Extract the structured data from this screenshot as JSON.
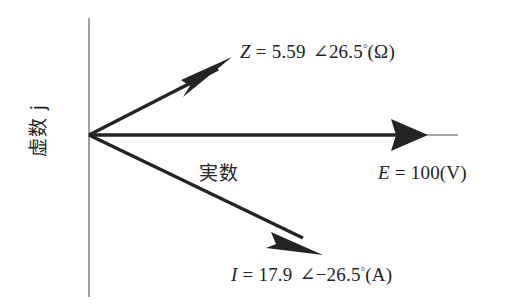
{
  "figure": {
    "type": "phasor-diagram",
    "background_color": "#ffffff",
    "ink_color": "#242424",
    "axis_color": "#8a8a8a"
  },
  "axes": {
    "imaginary_axis_label": "虚数 j",
    "real_axis_label": "実数",
    "origin": {
      "x": 89,
      "y": 135
    },
    "vertical_axis": {
      "x": 89,
      "y1": 18,
      "y2": 297
    },
    "horizontal_axis": {
      "y": 135,
      "x1": 89,
      "x2": 458
    }
  },
  "vectors": [
    {
      "name": "impedance",
      "symbol": "Z",
      "magnitude": "5.59",
      "angle": "26.5",
      "angle_sign": "+",
      "unit": "Ω",
      "label": "Z = 5.59 ∠26.5°(Ω)",
      "label_parts": {
        "symbol": "Z",
        "equals": "=",
        "magnitude": "5.59",
        "angle_symbol": "∠",
        "angle_value": "26.5",
        "degree": "°",
        "unit_paren": "(Ω)"
      },
      "tip": {
        "x": 232,
        "y": 57
      },
      "direction_deg": 26.5
    },
    {
      "name": "voltage",
      "symbol": "E",
      "magnitude": "100",
      "angle": "0",
      "unit": "V",
      "label": "E = 100(V)",
      "label_parts": {
        "symbol": "E",
        "equals": "=",
        "magnitude": "100",
        "unit_paren": "(V)"
      },
      "tip": {
        "x": 428,
        "y": 135
      },
      "direction_deg": 0
    },
    {
      "name": "current",
      "symbol": "I",
      "magnitude": "17.9",
      "angle": "26.5",
      "angle_sign": "−",
      "unit": "A",
      "label": "I = 17.9 ∠−26.5°(A)",
      "label_parts": {
        "symbol": "I",
        "equals": "=",
        "magnitude": "17.9",
        "angle_symbol": "∠",
        "angle_sign": "−",
        "angle_value": "26.5",
        "degree": "°",
        "unit_paren": "(A)"
      },
      "tip": {
        "x": 323,
        "y": 255
      },
      "direction_deg": -26.5
    }
  ]
}
